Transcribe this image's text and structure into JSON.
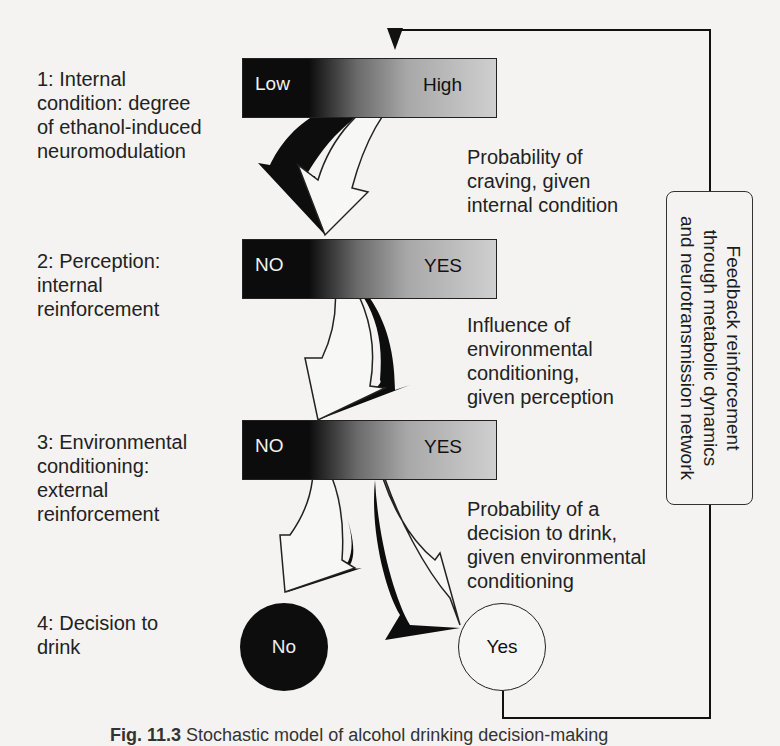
{
  "stages": [
    {
      "label": "1: Internal condition: degree of ethanol-induced neuromodulation",
      "lines": [
        "1: Internal",
        "condition: degree",
        "of ethanol-induced",
        "neuromodulation"
      ]
    },
    {
      "label": "2: Perception: internal reinforcement",
      "lines": [
        "2: Perception:",
        "internal",
        "reinforcement"
      ]
    },
    {
      "label": "3: Environmental conditioning: external reinforcement",
      "lines": [
        "3: Environmental",
        "conditioning:",
        "external",
        "reinforcement"
      ]
    },
    {
      "label": "4: Decision to drink",
      "lines": [
        "4: Decision to",
        "drink"
      ]
    }
  ],
  "bars": [
    {
      "low": "Low",
      "high": "High"
    },
    {
      "low": "NO",
      "high": "YES"
    },
    {
      "low": "NO",
      "high": "YES"
    }
  ],
  "notes": [
    {
      "lines": [
        "Probability of",
        "craving, given",
        "internal condition"
      ]
    },
    {
      "lines": [
        "Influence of",
        "environmental",
        "conditioning,",
        "given perception"
      ]
    },
    {
      "lines": [
        "Probability of a",
        "decision to drink,",
        "given environmental",
        "conditioning"
      ]
    }
  ],
  "outcomes": {
    "no": "No",
    "yes": "Yes"
  },
  "feedback": {
    "lines": [
      "Feedback reinforcement",
      "through metabolic dynamics",
      "and neurotransmission network"
    ]
  },
  "caption": {
    "fig": "Fig. 11.3",
    "text": "Stochastic model of alcohol drinking decision-making"
  }
}
